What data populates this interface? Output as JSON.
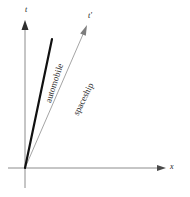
{
  "figure": {
    "type": "minkowski-spacetime-diagram",
    "background_color": "#ffffff"
  },
  "axes": {
    "time": {
      "label": "t",
      "color": "#8c8c8c",
      "origin_x": 25,
      "top_y": 22,
      "bottom_y": 188
    },
    "time_prime": {
      "label": "t'",
      "color": "#8c8c8c"
    },
    "space": {
      "label": "x",
      "color": "#8c8c8c",
      "y": 168,
      "left_x": 8,
      "right_x": 166
    }
  },
  "worldlines": [
    {
      "name": "automobile",
      "label": "automobile",
      "color": "#111111",
      "stroke_width": 2.2,
      "has_arrow": false,
      "start": {
        "x": 25,
        "y": 168
      },
      "end": {
        "x": 52,
        "y": 39
      },
      "label_rotation_deg": -72
    },
    {
      "name": "spaceship",
      "label": "spaceship",
      "color": "#9a9a9a",
      "stroke_width": 0.9,
      "has_arrow": true,
      "start": {
        "x": 25,
        "y": 168
      },
      "end": {
        "x": 86,
        "y": 28
      },
      "label_rotation_deg": -64
    }
  ],
  "colors": {
    "axis": "#8c8c8c",
    "automobile_line": "#111111",
    "spaceship_line": "#9a9a9a",
    "label_text": "#2b2b2b",
    "axis_text": "#1a1a1a"
  }
}
